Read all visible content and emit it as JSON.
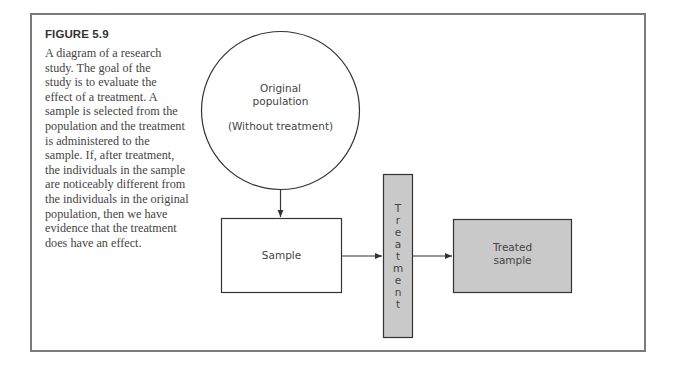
{
  "figure": {
    "title": "FIGURE 5.9",
    "caption_lines": [
      "A diagram of a research",
      "study. The goal of the",
      "study is to evaluate the",
      "effect of a treatment. A",
      "sample is selected from the",
      "population and the treatment",
      "is administered to the",
      "sample. If, after treatment,",
      "the individuals in the sample",
      "are noticeably different from",
      "the individuals in the original",
      "population, then we have",
      "evidence that the treatment",
      "does have an effect."
    ]
  },
  "diagram": {
    "population": {
      "line1": "Original",
      "line2": "population",
      "line3": "(Without treatment)"
    },
    "sample": {
      "label": "Sample"
    },
    "treatment": {
      "label": "Treatment",
      "letters": [
        "T",
        "r",
        "e",
        "a",
        "t",
        "m",
        "e",
        "n",
        "t"
      ]
    },
    "treated_sample": {
      "line1": "Treated",
      "line2": "sample"
    },
    "colors": {
      "stroke": "#333333",
      "gray_fill": "#c9c9c9",
      "frame": "#7a7a7a"
    }
  }
}
